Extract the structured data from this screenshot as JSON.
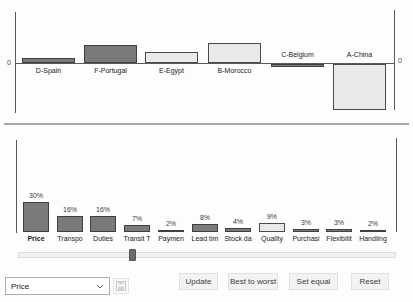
{
  "chart_data": [
    {
      "type": "bar",
      "title": "",
      "axis_zero_label": "0",
      "note": "country total scores, only zero is labeled on both side axes; values are relative score units estimated from pixels",
      "bars": [
        {
          "label": "D-Spain",
          "value": 5,
          "style": "dark",
          "label_position": "below"
        },
        {
          "label": "F-Portugal",
          "value": 18,
          "style": "dark",
          "label_position": "below"
        },
        {
          "label": "E-Egypt",
          "value": 11,
          "style": "light",
          "label_position": "below"
        },
        {
          "label": "B-Morocco",
          "value": 20,
          "style": "light",
          "label_position": "below"
        },
        {
          "label": "C-Belgium",
          "value": -3,
          "style": "dark",
          "label_position": "above"
        },
        {
          "label": "A-China",
          "value": -46,
          "style": "light",
          "label_position": "above"
        }
      ]
    },
    {
      "type": "bar",
      "title": "",
      "ylim": [
        0,
        35
      ],
      "note": "criteria weights in percent; Quality bar highlighted light; Price label bold",
      "bars": [
        {
          "label": "Price",
          "value": 30,
          "value_label": "30%",
          "style": "dark",
          "emphasis": true
        },
        {
          "label": "Transpo",
          "value": 16,
          "value_label": "16%",
          "style": "dark",
          "emphasis": false
        },
        {
          "label": "Duties",
          "value": 16,
          "value_label": "16%",
          "style": "dark",
          "emphasis": false
        },
        {
          "label": "Transit T",
          "value": 7,
          "value_label": "7%",
          "style": "dark",
          "emphasis": false
        },
        {
          "label": "Paymen",
          "value": 2,
          "value_label": "2%",
          "style": "dark",
          "emphasis": false
        },
        {
          "label": "Lead tim",
          "value": 8,
          "value_label": "8%",
          "style": "dark",
          "emphasis": false
        },
        {
          "label": "Stock da",
          "value": 4,
          "value_label": "4%",
          "style": "dark",
          "emphasis": false
        },
        {
          "label": "Quality",
          "value": 9,
          "value_label": "9%",
          "style": "light",
          "emphasis": false
        },
        {
          "label": "Purchasi",
          "value": 3,
          "value_label": "3%",
          "style": "dark",
          "emphasis": false
        },
        {
          "label": "Flexibilit",
          "value": 3,
          "value_label": "3%",
          "style": "dark",
          "emphasis": false
        },
        {
          "label": "Handling",
          "value": 2,
          "value_label": "2%",
          "style": "dark",
          "emphasis": false
        }
      ]
    }
  ],
  "weight_slider": {
    "value_percent": 30
  },
  "controls": {
    "criterion_select": {
      "value": "Price"
    },
    "save_button": {
      "icon": "floppy-disk",
      "enabled": false
    },
    "action_buttons": [
      {
        "label": "Update"
      },
      {
        "label": "Best to worst"
      },
      {
        "label": "Set equal"
      },
      {
        "label": "Reset"
      }
    ]
  },
  "colors": {
    "dark_bar": "#7a7a7a",
    "light_bar": "#e9e9e9",
    "bar_border": "#3f3f3f",
    "axis": "#5a5a5a",
    "divider": "#a8a8a8",
    "button_bg": "#f3f3f3",
    "button_border": "#e0e0e0",
    "text": "#333333"
  }
}
